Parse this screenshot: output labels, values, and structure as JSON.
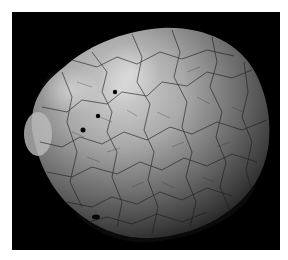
{
  "image": {
    "subject": "SEM micrograph of a rounded specimen with cracked polygonal surface texture",
    "background_color": "#000000",
    "page_color": "#ffffff",
    "specimen_highlight": "#cfcfcf",
    "specimen_shadow": "#2a2a2a",
    "crack_color": "#1a1a1a",
    "pore_color": "#050505"
  }
}
